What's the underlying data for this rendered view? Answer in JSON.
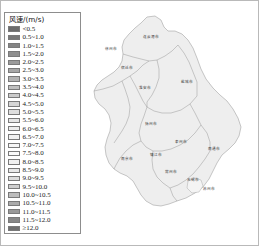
{
  "figure": {
    "kind": "choropleth-map",
    "region_name": "Jiangsu Province"
  },
  "legend": {
    "title": "风速/(m/s)",
    "entries": [
      {
        "label": "<0.5",
        "color": "#6b6b6b"
      },
      {
        "label": "0.5~1.0",
        "color": "#787878"
      },
      {
        "label": "1.0~1.5",
        "color": "#848484"
      },
      {
        "label": "1.5~2.0",
        "color": "#8f8f8f"
      },
      {
        "label": "2.0~2.5",
        "color": "#9b9b9b"
      },
      {
        "label": "2.5~3.0",
        "color": "#a7a7a7"
      },
      {
        "label": "3.0~3.5",
        "color": "#b3b3b3"
      },
      {
        "label": "3.5~4.0",
        "color": "#bfbfbf"
      },
      {
        "label": "4.0~4.5",
        "color": "#cbcbcb"
      },
      {
        "label": "4.5~5.0",
        "color": "#d5d5d5"
      },
      {
        "label": "5.0~5.5",
        "color": "#dedede"
      },
      {
        "label": "5.5~6.0",
        "color": "#e6e6e6"
      },
      {
        "label": "6.0~6.5",
        "color": "#ededed"
      },
      {
        "label": "6.5~7.0",
        "color": "#f2f2f2"
      },
      {
        "label": "7.0~7.5",
        "color": "#f6f6f6"
      },
      {
        "label": "7.5~8.0",
        "color": "#fafafa"
      },
      {
        "label": "8.0~8.5",
        "color": "#f1f1f1"
      },
      {
        "label": "8.5~9.0",
        "color": "#e8e8e8"
      },
      {
        "label": "9.0~9.5",
        "color": "#dcdcdc"
      },
      {
        "label": "9.5~10.0",
        "color": "#cfcfcf"
      },
      {
        "label": "10.0~10.5",
        "color": "#bdbdbd"
      },
      {
        "label": "10.5~11.0",
        "color": "#ababab"
      },
      {
        "label": "11.0~11.5",
        "color": "#999999"
      },
      {
        "label": "11.5~12.0",
        "color": "#878787"
      },
      {
        "label": "≥12.0",
        "color": "#707070"
      }
    ]
  },
  "map": {
    "fill": "#eeeeee",
    "stroke": "#9a9a9a",
    "labels": [
      {
        "text": "徐州市",
        "x": 22,
        "y": 47
      },
      {
        "text": "连云港市",
        "x": 62,
        "y": 35
      },
      {
        "text": "宿迁市",
        "x": 38,
        "y": 66
      },
      {
        "text": "淮安市",
        "x": 56,
        "y": 86
      },
      {
        "text": "盐城市",
        "x": 98,
        "y": 80
      },
      {
        "text": "扬州市",
        "x": 62,
        "y": 122
      },
      {
        "text": "泰州市",
        "x": 92,
        "y": 140
      },
      {
        "text": "南通市",
        "x": 125,
        "y": 147
      },
      {
        "text": "南京市",
        "x": 38,
        "y": 157
      },
      {
        "text": "镇江市",
        "x": 67,
        "y": 153
      },
      {
        "text": "常州市",
        "x": 82,
        "y": 170
      },
      {
        "text": "无锡市",
        "x": 104,
        "y": 178
      },
      {
        "text": "苏州市",
        "x": 120,
        "y": 187
      }
    ]
  }
}
